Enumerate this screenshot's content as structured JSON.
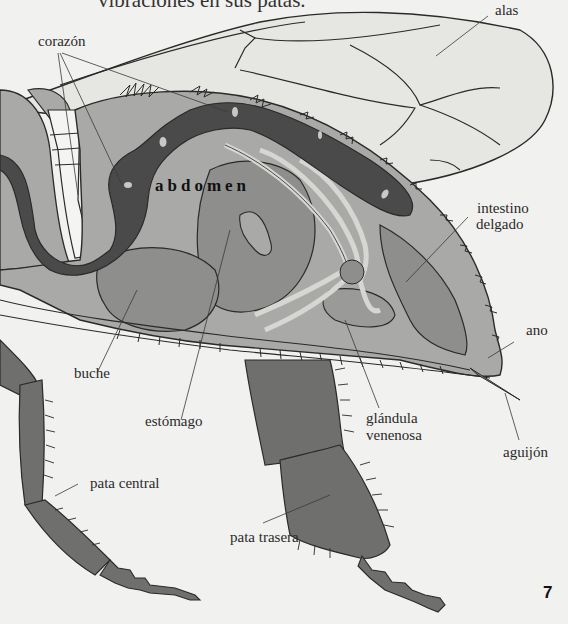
{
  "intro_text": "vibraciones en sus patas.",
  "region_label": "abdomen",
  "page_number": "7",
  "labels": {
    "alas": "alas",
    "corazon": "corazón",
    "intestino_line1": "intestino",
    "intestino_line2": "delgado",
    "ano": "ano",
    "buche": "buche",
    "estomago": "estómago",
    "glandula_line1": "glándula",
    "glandula_line2": "venenosa",
    "aguijon": "aguijón",
    "pata_central": "pata central",
    "pata_trasera": "pata trasera"
  },
  "colors": {
    "background": "#f1f1ef",
    "wing": "#e6e6e3",
    "abdomen_light": "#a9a9a7",
    "abdomen_mid": "#8e8e8c",
    "heart_dark": "#4a4a4a",
    "leg": "#6f6f6d",
    "outline": "#2a2a2a"
  }
}
